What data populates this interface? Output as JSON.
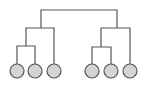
{
  "diagram": {
    "type": "dendrogram",
    "colors": {
      "line": "#555555",
      "leaf_fill": "#d4d4d4",
      "leaf_stroke": "#555555",
      "background": "#ffffff"
    },
    "leaves": [
      {
        "id": "leaf-1",
        "cx": 17,
        "cy": 71
      },
      {
        "id": "leaf-2",
        "cx": 35,
        "cy": 71
      },
      {
        "id": "leaf-3",
        "cx": 54,
        "cy": 71
      },
      {
        "id": "leaf-4",
        "cx": 92,
        "cy": 71
      },
      {
        "id": "leaf-5",
        "cx": 111,
        "cy": 71
      },
      {
        "id": "leaf-6",
        "cx": 130,
        "cy": 71
      }
    ],
    "leaf_radius": 7,
    "clusters": [
      {
        "id": "cluster-1-2",
        "children": [
          "leaf-1",
          "leaf-2"
        ]
      },
      {
        "id": "cluster-1-2-3",
        "children": [
          "cluster-1-2",
          "leaf-3"
        ]
      },
      {
        "id": "cluster-4-5",
        "children": [
          "leaf-4",
          "leaf-5"
        ]
      },
      {
        "id": "cluster-4-5-6",
        "children": [
          "cluster-4-5",
          "leaf-6"
        ]
      },
      {
        "id": "root",
        "children": [
          "cluster-1-2-3",
          "cluster-4-5-6"
        ]
      }
    ]
  }
}
